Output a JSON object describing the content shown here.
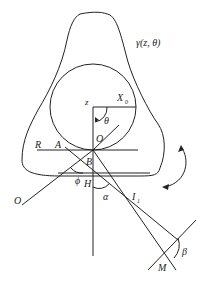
{
  "diagram": {
    "labels": {
      "gamma": "γ(z, θ)",
      "z": "z",
      "x0": "X",
      "x0_sub": "0",
      "theta": "θ",
      "o_center": "O",
      "r": "R",
      "a": "A",
      "b": "B",
      "phi": "ϕ",
      "h": "H",
      "alpha": "α",
      "i1": "I",
      "i1_sub": "1",
      "o_left": "O",
      "m": "M",
      "beta": "β"
    },
    "colors": {
      "stroke": "#222222",
      "background": "#ffffff"
    }
  }
}
